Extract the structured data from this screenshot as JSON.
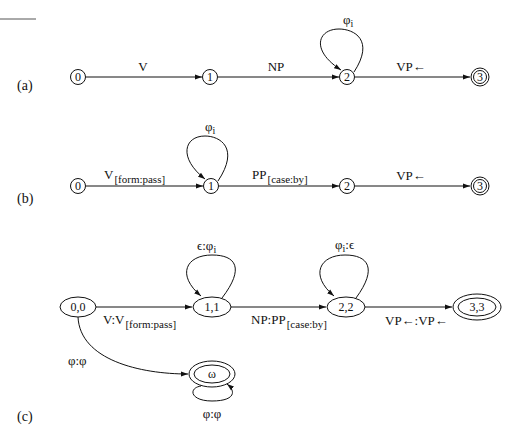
{
  "top_rule": true,
  "panels": [
    {
      "id": "a",
      "label": "(a)",
      "states": [
        {
          "id": "s0",
          "name": "0",
          "final": false
        },
        {
          "id": "s1",
          "name": "1",
          "final": false
        },
        {
          "id": "s2",
          "name": "2",
          "final": false
        },
        {
          "id": "s3",
          "name": "3",
          "final": true
        }
      ],
      "edges": [
        {
          "from": "0",
          "to": "1",
          "label": "V"
        },
        {
          "from": "1",
          "to": "2",
          "label": "NP"
        },
        {
          "from": "2",
          "to": "2",
          "label": "φ",
          "label_sub": "i"
        },
        {
          "from": "2",
          "to": "3",
          "label": "VP←"
        }
      ]
    },
    {
      "id": "b",
      "label": "(b)",
      "states": [
        {
          "id": "s0",
          "name": "0",
          "final": false
        },
        {
          "id": "s1",
          "name": "1",
          "final": false
        },
        {
          "id": "s2",
          "name": "2",
          "final": false
        },
        {
          "id": "s3",
          "name": "3",
          "final": true
        }
      ],
      "edges": [
        {
          "from": "0",
          "to": "1",
          "label": "V",
          "label_sub": "[form:pass]"
        },
        {
          "from": "1",
          "to": "1",
          "label": "φ",
          "label_sub": "i"
        },
        {
          "from": "1",
          "to": "2",
          "label": "PP",
          "label_sub": "[case:by]"
        },
        {
          "from": "2",
          "to": "3",
          "label": "VP←"
        }
      ]
    },
    {
      "id": "c",
      "label": "(c)",
      "states": [
        {
          "id": "s00",
          "name": "0,0",
          "final": false
        },
        {
          "id": "s11",
          "name": "1,1",
          "final": false
        },
        {
          "id": "s22",
          "name": "2,2",
          "final": false
        },
        {
          "id": "s33",
          "name": "3,3",
          "final": true
        },
        {
          "id": "somega",
          "name": "ω",
          "final": true
        }
      ],
      "edges": [
        {
          "from": "0,0",
          "to": "1,1",
          "label": "V:V",
          "label_sub": "[form:pass]"
        },
        {
          "from": "1,1",
          "to": "1,1",
          "label": "ϵ:φ",
          "label_sub": "i"
        },
        {
          "from": "1,1",
          "to": "2,2",
          "label": "NP:PP",
          "label_sub": "[case:by]"
        },
        {
          "from": "2,2",
          "to": "2,2",
          "label": "φ",
          "label_sub": "i",
          "label_suffix": ":ϵ"
        },
        {
          "from": "2,2",
          "to": "3,3",
          "label": "VP←:VP←"
        },
        {
          "from": "0,0",
          "to": "ω",
          "label": "φ:φ"
        },
        {
          "from": "ω",
          "to": "ω",
          "label": "φ:φ"
        }
      ]
    }
  ]
}
